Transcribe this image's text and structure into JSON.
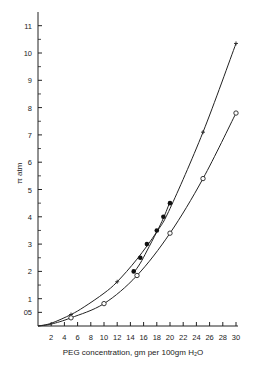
{
  "chart_data": {
    "type": "line",
    "title": "",
    "xlabel": "PEG concentration, gm per 100gm H₂O",
    "ylabel": "π atm",
    "xlim": [
      0,
      30
    ],
    "ylim": [
      0,
      11.5
    ],
    "grid": false,
    "legend": "none",
    "x_ticks": [
      2,
      4,
      6,
      8,
      10,
      12,
      14,
      16,
      18,
      20,
      22,
      24,
      26,
      28,
      30
    ],
    "x_tick_labels": [
      "2",
      "4",
      "6",
      "8",
      "10",
      "12",
      "14",
      "16",
      "18",
      "20",
      "22",
      "24",
      "26",
      "28",
      "30"
    ],
    "y_ticks": [
      0.5,
      1,
      2,
      3,
      4,
      5,
      6,
      7,
      8,
      9,
      10,
      11
    ],
    "y_tick_labels": [
      "05",
      "1",
      "2",
      "3",
      "4",
      "5",
      "6",
      "7",
      "8",
      "9",
      "10",
      "11"
    ],
    "series": [
      {
        "name": "upper (crosses)",
        "marker": "cross",
        "curve": [
          [
            0,
            0
          ],
          [
            2,
            0.1
          ],
          [
            5,
            0.42
          ],
          [
            7,
            0.7
          ],
          [
            10,
            1.2
          ],
          [
            12,
            1.62
          ],
          [
            15,
            2.45
          ],
          [
            18,
            3.45
          ],
          [
            20,
            4.3
          ],
          [
            25,
            7.1
          ],
          [
            30,
            10.35
          ]
        ],
        "points": [
          [
            5,
            0.42
          ],
          [
            12,
            1.62
          ],
          [
            25,
            7.1
          ],
          [
            30,
            10.35
          ]
        ]
      },
      {
        "name": "middle (filled circles)",
        "marker": "filled-circle",
        "curve": [
          [
            14.5,
            1.95
          ],
          [
            15.5,
            2.3
          ],
          [
            16.5,
            2.75
          ],
          [
            18,
            3.45
          ],
          [
            19,
            3.95
          ],
          [
            20,
            4.55
          ]
        ],
        "points": [
          [
            14.5,
            2.0
          ],
          [
            15.5,
            2.5
          ],
          [
            16.5,
            3.0
          ],
          [
            18,
            3.5
          ],
          [
            19,
            4.0
          ],
          [
            20,
            4.5
          ]
        ]
      },
      {
        "name": "lower (open circles)",
        "marker": "open-circle",
        "curve": [
          [
            0,
            0
          ],
          [
            2,
            0.07
          ],
          [
            5,
            0.3
          ],
          [
            10,
            0.82
          ],
          [
            15,
            1.85
          ],
          [
            20,
            3.4
          ],
          [
            25,
            5.4
          ],
          [
            30,
            7.8
          ]
        ],
        "points": [
          [
            5,
            0.3
          ],
          [
            10,
            0.82
          ],
          [
            15,
            1.85
          ],
          [
            20,
            3.4
          ],
          [
            25,
            5.4
          ],
          [
            30,
            7.8
          ]
        ]
      }
    ]
  }
}
